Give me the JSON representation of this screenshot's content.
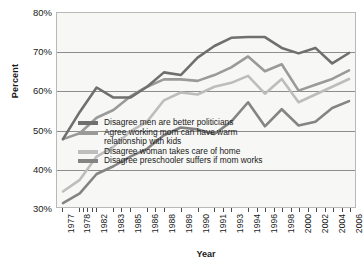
{
  "chart_data": {
    "type": "line",
    "title": "",
    "xlabel": "Year",
    "ylabel": "Percent",
    "ylim": [
      30,
      80
    ],
    "ytick_labels": [
      "30%",
      "40%",
      "50%",
      "60%",
      "70%",
      "80%"
    ],
    "ytick_values": [
      30,
      40,
      50,
      60,
      70,
      80
    ],
    "grid": true,
    "legend_position": "lower-center-inside",
    "x": [
      1977,
      1978,
      1982,
      1983,
      1985,
      1986,
      1988,
      1989,
      1990,
      1991,
      1993,
      1994,
      1996,
      1998,
      2000,
      2002,
      2004,
      2006
    ],
    "xtick_labels": [
      "1977",
      "1978",
      "1982",
      "1983",
      "1985",
      "1986",
      "1988",
      "1989",
      "1990",
      "1991",
      "1993",
      "1994",
      "1996",
      "1998",
      "2000",
      "2002",
      "2004",
      "2006"
    ],
    "series": [
      {
        "name": "Disagree men are better politicians",
        "color": "#6f6f6f",
        "values": [
          47.5,
          54.5,
          60.8,
          58.2,
          58.2,
          61.0,
          64.7,
          64.0,
          68.5,
          71.5,
          73.6,
          73.8,
          73.8,
          71.0,
          69.6,
          71.0,
          67.0,
          69.7
        ]
      },
      {
        "name": "Agree working mom can have warm\nrelationship with kids",
        "color": "#9a9a9a",
        "values": [
          47.5,
          49.0,
          53.0,
          55.0,
          58.5,
          61.0,
          62.9,
          62.9,
          62.5,
          64.0,
          66.0,
          68.8,
          65.0,
          66.8,
          60.0,
          61.5,
          63.0,
          65.2
        ]
      },
      {
        "name": "Disagree woman takes care of home",
        "color": "#bdbdbd",
        "values": [
          34.0,
          37.0,
          43.0,
          45.5,
          49.5,
          52.0,
          57.5,
          59.5,
          59.0,
          61.0,
          62.0,
          63.8,
          59.2,
          63.0,
          57.0,
          59.0,
          61.0,
          63.0
        ]
      },
      {
        "name": "Disagree preschooler suffers if mom works",
        "color": "#848484",
        "values": [
          31.0,
          33.5,
          38.5,
          40.5,
          43.0,
          45.0,
          48.5,
          50.5,
          50.0,
          48.8,
          52.0,
          57.0,
          50.8,
          55.2,
          51.0,
          52.0,
          55.5,
          57.3
        ]
      }
    ]
  }
}
